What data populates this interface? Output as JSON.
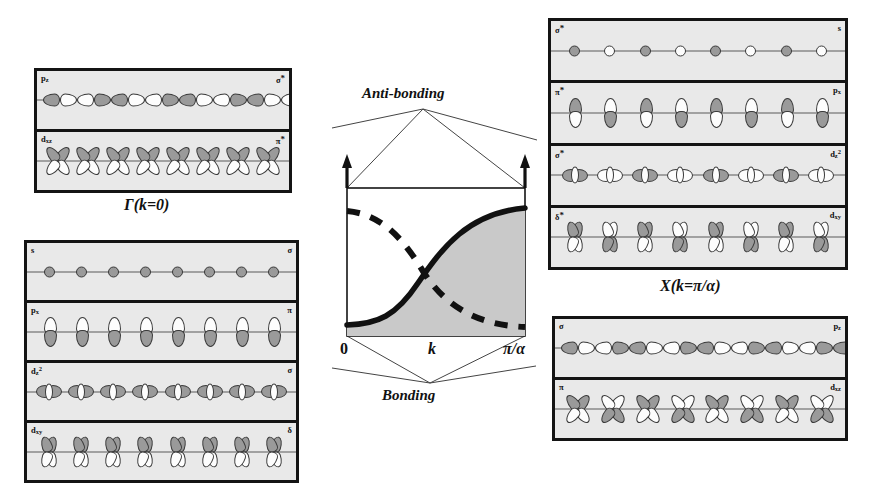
{
  "figure": {
    "type": "orbital-band-diagram"
  },
  "captions": {
    "gamma": "Γ(k=0)",
    "x_point": "X(k=π/α)"
  },
  "band_diagram": {
    "top_label": "Anti-bonding",
    "bottom_label": "Bonding",
    "x_axis_label": "k",
    "x_ticks": [
      "0",
      "π/α"
    ],
    "curves": [
      {
        "name": "rising-band",
        "style": "solid",
        "shaded": true
      },
      {
        "name": "falling-band",
        "style": "dashed",
        "shaded": false
      }
    ]
  },
  "panels": {
    "gamma_antibonding": {
      "position": "top-left",
      "rows": [
        {
          "orbital": "p_z",
          "orbital_sub": "z",
          "symmetry": "σ",
          "star": true,
          "shape": "pz-chain",
          "count": 13,
          "alternating": true
        },
        {
          "orbital": "d_xz",
          "orbital_sub": "xz",
          "symmetry": "π",
          "star": true,
          "shape": "clover",
          "count": 8,
          "alternating": false
        }
      ]
    },
    "gamma_bonding": {
      "position": "bottom-left",
      "rows": [
        {
          "orbital": "s",
          "orbital_sub": "",
          "symmetry": "σ",
          "star": false,
          "shape": "s-circle",
          "count": 8,
          "alternating": false
        },
        {
          "orbital": "p_x",
          "orbital_sub": "x",
          "symmetry": "π",
          "star": false,
          "shape": "px",
          "count": 8,
          "alternating": false
        },
        {
          "orbital": "d_z2",
          "orbital_sub": "z2",
          "symmetry": "σ",
          "star": false,
          "shape": "dz2",
          "count": 8,
          "alternating": false
        },
        {
          "orbital": "d_xy",
          "orbital_sub": "xy",
          "symmetry": "δ",
          "star": false,
          "shape": "bow",
          "count": 8,
          "alternating": false
        }
      ]
    },
    "x_antibonding": {
      "position": "top-right",
      "rows": [
        {
          "orbital": "s",
          "orbital_sub": "",
          "symmetry": "σ",
          "star": true,
          "shape": "s-circle",
          "count": 8,
          "alternating": true
        },
        {
          "orbital": "p_x",
          "orbital_sub": "x",
          "symmetry": "π",
          "star": true,
          "shape": "px",
          "count": 8,
          "alternating": true
        },
        {
          "orbital": "d_z2",
          "orbital_sub": "z2",
          "symmetry": "σ",
          "star": true,
          "shape": "dz2",
          "count": 8,
          "alternating": true
        },
        {
          "orbital": "d_xy",
          "orbital_sub": "xy",
          "symmetry": "δ",
          "star": true,
          "shape": "bow",
          "count": 8,
          "alternating": true
        }
      ]
    },
    "x_bonding": {
      "position": "bottom-right",
      "rows": [
        {
          "orbital": "p_z",
          "orbital_sub": "z",
          "symmetry": "σ",
          "star": false,
          "shape": "pz-chain",
          "count": 13,
          "alternating": true
        },
        {
          "orbital": "d_xz",
          "orbital_sub": "xz",
          "symmetry": "π",
          "star": false,
          "shape": "clover",
          "count": 8,
          "alternating": true
        }
      ]
    }
  },
  "labels": {
    "sigma": "σ",
    "pi": "π",
    "delta": "δ",
    "star": "*",
    "s": "s",
    "p": "p",
    "d": "d",
    "sub_z": "z",
    "sub_x": "x",
    "sub_xy": "xy",
    "sub_xz": "xz",
    "sub_z2": "z²"
  },
  "colors": {
    "frame": "#141414",
    "panel_bg": "#e9e9e9",
    "orbital_dark": "#9a9a9a",
    "orbital_light": "#fdfdfd",
    "shade": "#c9c9c9",
    "axis": "#5b5b5b"
  }
}
